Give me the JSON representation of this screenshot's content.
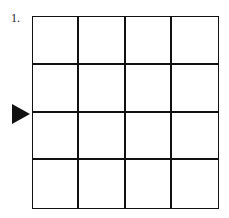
{
  "puzzle": {
    "number_label": "1.",
    "grid": {
      "rows": 4,
      "cols": 4
    },
    "arrow": {
      "direction": "right",
      "pointing_at_row_boundary": 2,
      "side": "left"
    }
  }
}
